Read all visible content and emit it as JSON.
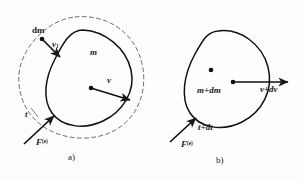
{
  "figure": {
    "background_color": "#fdfdfd",
    "ink_color": "#1a1a1a",
    "width": 302,
    "height": 181
  },
  "panels": [
    {
      "id": "a",
      "caption": "a)",
      "description": "System at time t: body of mass m moving with velocity v, plus a separate element dm moving with velocity v-sub-1, enclosed by a dashed control boundary.",
      "boundary_style": "dashed",
      "labels": {
        "element_mass": "dm",
        "element_velocity": "v",
        "element_velocity_subscript": "1",
        "body_mass": "m",
        "body_velocity": "v",
        "time": "t",
        "external_force": "F",
        "external_force_superscript": "(e)"
      }
    },
    {
      "id": "b",
      "caption": "b)",
      "description": "System at time t+dt: combined body of mass m+dm moving with velocity v+dv, drawn with a solid boundary only.",
      "boundary_style": "solid",
      "labels": {
        "body_mass": "m+dm",
        "body_velocity": "v+dv",
        "time": "t+dt",
        "external_force": "F",
        "external_force_superscript": "(e)"
      }
    }
  ],
  "icons": {
    "vector_arrow": "arrow-icon",
    "point_mass": "dot-icon"
  }
}
